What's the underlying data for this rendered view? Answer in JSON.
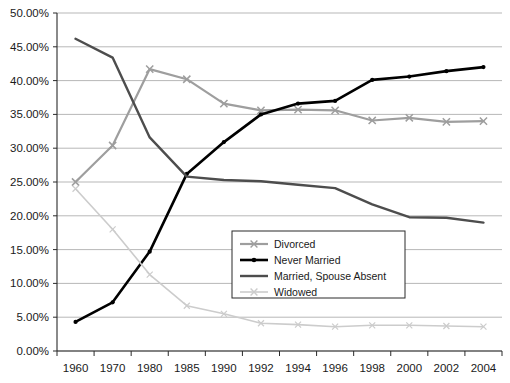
{
  "clipped_header_text": "",
  "chart_data": {
    "type": "line",
    "title": "",
    "subtitle": "",
    "xlabel": "",
    "ylabel": "",
    "grid": true,
    "legend_position": "center-bottom-inside",
    "categories": [
      "1960",
      "1970",
      "1980",
      "1985",
      "1990",
      "1992",
      "1994",
      "1996",
      "1998",
      "2000",
      "2002",
      "2004"
    ],
    "ylim": [
      0,
      50
    ],
    "ytick_labels": [
      "0.00%",
      "5.00%",
      "10.00%",
      "15.00%",
      "20.00%",
      "25.00%",
      "30.00%",
      "35.00%",
      "40.00%",
      "45.00%",
      "50.00%"
    ],
    "ytick_values": [
      0,
      5,
      10,
      15,
      20,
      25,
      30,
      35,
      40,
      45,
      50
    ],
    "y_unit": "%",
    "series": [
      {
        "name": "Divorced",
        "color": "#9e9e9e",
        "marker": "x",
        "values": [
          25.0,
          30.4,
          41.7,
          40.2,
          36.6,
          35.6,
          35.7,
          35.6,
          34.1,
          34.5,
          33.9,
          34.0
        ]
      },
      {
        "name": "Never Married",
        "color": "#000000",
        "marker": "dot",
        "values": [
          4.3,
          7.2,
          14.7,
          26.2,
          30.9,
          35.0,
          36.6,
          37.0,
          40.1,
          40.6,
          41.4,
          42.0
        ]
      },
      {
        "name": "Married, Spouse Absent",
        "color": "#4d4d4d",
        "marker": "none",
        "values": [
          46.2,
          43.4,
          31.6,
          25.8,
          25.3,
          25.1,
          24.6,
          24.1,
          21.7,
          19.8,
          19.7,
          19.0
        ]
      },
      {
        "name": "Widowed",
        "color": "#cccccc",
        "marker": "dot-light",
        "values": [
          24.0,
          18.0,
          11.3,
          6.7,
          5.5,
          4.1,
          3.9,
          3.6,
          3.8,
          3.8,
          3.7,
          3.6
        ]
      }
    ]
  },
  "legend": {
    "entries": [
      {
        "label": "Divorced"
      },
      {
        "label": "Never Married"
      },
      {
        "label": "Married, Spouse Absent"
      },
      {
        "label": "Widowed"
      }
    ]
  }
}
